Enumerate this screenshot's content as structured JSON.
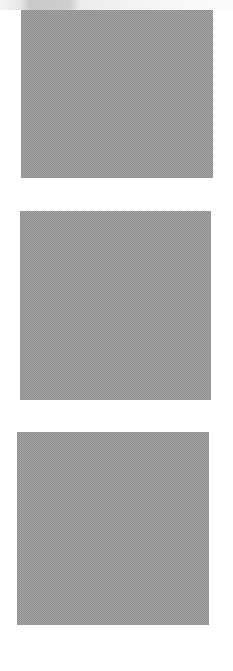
{
  "page": {
    "background": "#ffffff",
    "top_shade_color": "#c8c8c8"
  },
  "placeholders": [
    {
      "name": "placeholder-image-1",
      "caption": "",
      "fill_color": "#a6a6a6"
    },
    {
      "name": "placeholder-image-2",
      "caption": "",
      "fill_color": "#a6a6a6"
    },
    {
      "name": "placeholder-image-3",
      "caption": "",
      "fill_color": "#a6a6a6"
    }
  ],
  "footer": {
    "text": ""
  }
}
